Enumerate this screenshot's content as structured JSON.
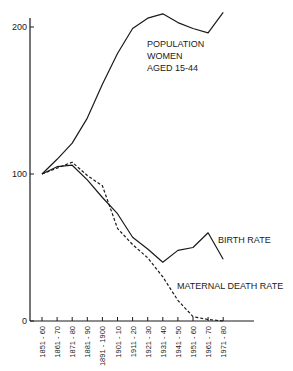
{
  "chart_data": {
    "type": "line",
    "title": "",
    "xlabel": "",
    "ylabel": "",
    "ylim": [
      0,
      210
    ],
    "yticks": [
      0,
      100,
      200
    ],
    "grid": false,
    "legend": "inline labels",
    "categories": [
      "1851-60",
      "1861-70",
      "1871-80",
      "1881-90",
      "1891-1900",
      "1901-10",
      "1911-20",
      "1921-30",
      "1931-40",
      "1941-50",
      "1951-60",
      "1961-70",
      "1971-80"
    ],
    "series": [
      {
        "name": "POPULATION WOMEN AGED 15-44",
        "style": "solid",
        "label_lines": [
          "POPULATION",
          "WOMEN",
          "AGED  15-44"
        ],
        "values": [
          100,
          110,
          121,
          138,
          161,
          182,
          199,
          206,
          209,
          203,
          199,
          196,
          210
        ]
      },
      {
        "name": "BIRTH RATE",
        "style": "solid",
        "label_lines": [
          "BIRTH  RATE"
        ],
        "values": [
          100,
          105,
          106,
          96,
          84,
          73,
          57,
          49,
          40,
          48,
          50,
          60,
          42
        ]
      },
      {
        "name": "MATERNAL DEATH RATE",
        "style": "dashed",
        "label_lines": [
          "MATERNAL  DEATH  RATE"
        ],
        "values": [
          100,
          104,
          108,
          99,
          92,
          63,
          52,
          43,
          30,
          14,
          3,
          1,
          0
        ]
      }
    ]
  }
}
